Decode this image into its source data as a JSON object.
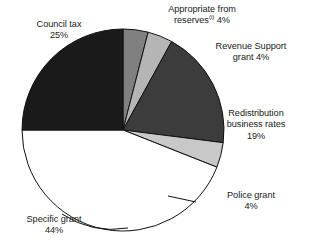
{
  "chart_data": {
    "type": "pie",
    "title": "",
    "subtitle": "",
    "xlabel": "",
    "ylabel": "",
    "legend_position": "none",
    "grid": false,
    "total_percent": 100,
    "start_angle_deg": 0,
    "direction": "clockwise",
    "categories": [
      "Appropriate from reserves",
      "Revenue Support grant",
      "Redistribution business rates",
      "Police grant",
      "Specific grant",
      "Council tax"
    ],
    "values": [
      4,
      4,
      19,
      4,
      44,
      25
    ],
    "units": "%",
    "slices": [
      {
        "name": "Appropriate from reserves",
        "label_line1": "Appropriate from",
        "label_line2": "reserves",
        "footnote_marker": "(i)",
        "percent": 4,
        "percent_text": "4%",
        "color": "#808080"
      },
      {
        "name": "Revenue Support grant",
        "label_line1": "Revenue Support",
        "label_line2": "grant 4%",
        "percent": 4,
        "percent_text": "4%",
        "color": "#b5b5b5"
      },
      {
        "name": "Redistribution business rates",
        "label_line1": "Redistribution",
        "label_line2": "business rates",
        "percent": 19,
        "percent_text": "19%",
        "color": "#3c3c3c"
      },
      {
        "name": "Police grant",
        "label_line1": "Police grant",
        "percent": 4,
        "percent_text": "4%",
        "color": "#c8c8c8"
      },
      {
        "name": "Specific grant",
        "label_line1": "Specific grant",
        "percent": 44,
        "percent_text": "44%",
        "color": "#ffffff"
      },
      {
        "name": "Council tax",
        "label_line1": "Council tax",
        "percent": 25,
        "percent_text": "25%",
        "color": "#1a1a1a"
      }
    ],
    "colors": {
      "outline": "#111111",
      "text": "#1a1a1a",
      "background": "#ffffff"
    }
  }
}
